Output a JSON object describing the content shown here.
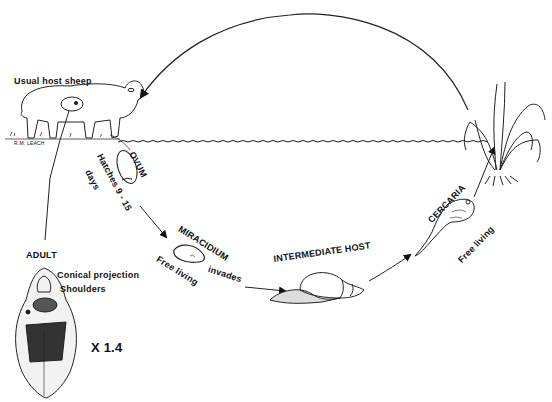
{
  "diagram": {
    "type": "life-cycle",
    "colors": {
      "ink": "#111111",
      "background": "#ffffff"
    }
  },
  "labels": {
    "host": "Usual host sheep",
    "artist": "R.M. LEACH",
    "ovum": "OVUM",
    "hatches": "Hatches 9 - 15",
    "days": "days",
    "miracidium": "MIRACIDIUM",
    "free_living_1": "Free living",
    "invades": "invades",
    "intermediate_host": "INTERMEDIATE HOST",
    "cercaria": "CERCARIA",
    "free_living_2": "Free living",
    "adult": "ADULT",
    "conical_projection": "Conical projection",
    "shoulders": "Shoulders",
    "magnification": "X 1.4"
  }
}
